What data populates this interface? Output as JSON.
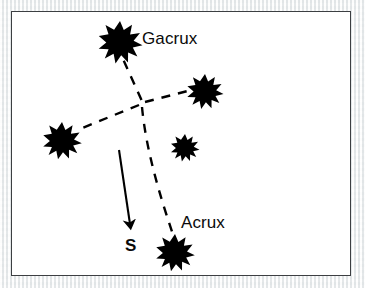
{
  "figure": {
    "kind": "star-constellation-diagram",
    "background_color": "#eef0f0",
    "frame_color": "#3c3f42",
    "frame_fill": "#ffffff",
    "ink_color": "#000000"
  },
  "labels": {
    "gacrux": "Gacrux",
    "acrux": "Acrux",
    "south": "S"
  },
  "stars": [
    {
      "name": "gacrux",
      "label": "Gacrux",
      "cx": 120,
      "cy": 38,
      "r": 17,
      "points": 9
    },
    {
      "name": "mimosa",
      "label": "",
      "cx": 205,
      "cy": 88,
      "r": 14,
      "points": 9
    },
    {
      "name": "delta-crucis",
      "label": "",
      "cx": 62,
      "cy": 137,
      "r": 15,
      "points": 9
    },
    {
      "name": "epsilon-crucis",
      "label": "",
      "cx": 185,
      "cy": 145,
      "r": 11,
      "points": 9
    },
    {
      "name": "acrux",
      "label": "Acrux",
      "cx": 175,
      "cy": 249,
      "r": 15,
      "points": 9
    }
  ],
  "crossing_point": {
    "x": 142,
    "y": 103
  },
  "dashed_arms": [
    {
      "name": "arm-to-gacrux",
      "from": [
        142,
        103
      ],
      "to": [
        122,
        58
      ]
    },
    {
      "name": "arm-to-mimosa",
      "from": [
        142,
        103
      ],
      "to": [
        190,
        90
      ]
    },
    {
      "name": "arm-to-delta-crucis",
      "from": [
        142,
        103
      ],
      "to": [
        79,
        129
      ]
    },
    {
      "name": "arm-to-acrux",
      "from": [
        142,
        103
      ],
      "to": [
        172,
        233
      ]
    }
  ],
  "south_arrow": {
    "name": "south-pointer-arrow",
    "from": [
      119,
      150
    ],
    "to": [
      131,
      228
    ],
    "label": "S",
    "label_position": [
      131,
      245
    ]
  }
}
